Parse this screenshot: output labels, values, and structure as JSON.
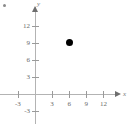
{
  "chart_data": {
    "type": "scatter",
    "title": "",
    "xlabel": "x",
    "ylabel": "y",
    "grid": false,
    "legend": "none",
    "xlim": [
      -4.5,
      14
    ],
    "ylim": [
      -4.5,
      14
    ],
    "xticks": [
      -3,
      3,
      6,
      9,
      12
    ],
    "xtick_labels": [
      "-3",
      "3",
      "6",
      "9",
      "12"
    ],
    "yticks": [
      -3,
      3,
      6,
      9,
      12
    ],
    "ytick_labels": [
      "-3",
      "3",
      "6",
      "9",
      "12"
    ],
    "points": [
      {
        "x": 6,
        "y": 9,
        "label": "",
        "marker": "filled-circle",
        "color": "#000000"
      }
    ]
  },
  "axes": {
    "x_name": "x",
    "y_name": "y",
    "axis_color": "#b3b3b3",
    "tick_color": "#9a9a9a",
    "label_color": "#6b6b6b"
  },
  "geometry": {
    "origin_x": 35,
    "origin_y": 94,
    "unit_px": 5.7
  }
}
